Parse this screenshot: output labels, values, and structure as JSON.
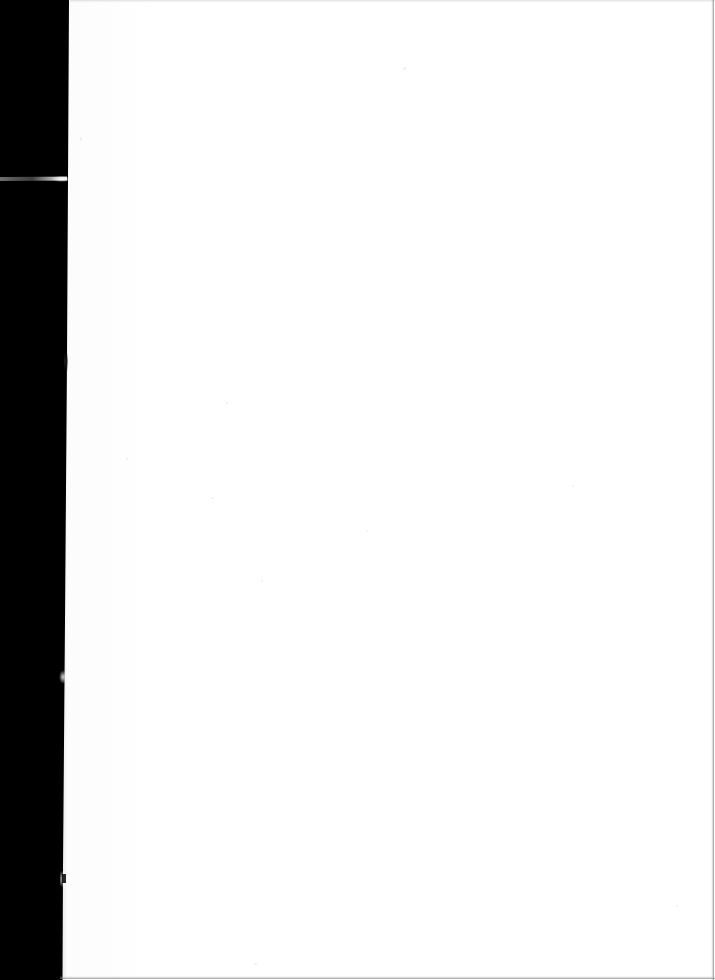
{
  "document": {
    "page_type": "scanned-page",
    "content_text": "",
    "is_blank": true,
    "width_px": 715,
    "height_px": 980
  },
  "colors": {
    "paper": "#ffffff",
    "gutter": "#000000",
    "hairline": "#8a8a8e",
    "streak": "#e1e1e1"
  },
  "regions": {
    "paper_label": "blank scanned page",
    "gutter_label": "scanner gutter shadow",
    "top_edge_label": "top scan edge line",
    "bottom_edge_label": "bottom scan edge line",
    "right_edge_label": "right scan edge line"
  },
  "artifacts": {
    "streak_label": "light streak across gutter",
    "tick_label": "dark edge tick",
    "nick_label": "bright edge nick",
    "notch_label": "edge notch"
  }
}
